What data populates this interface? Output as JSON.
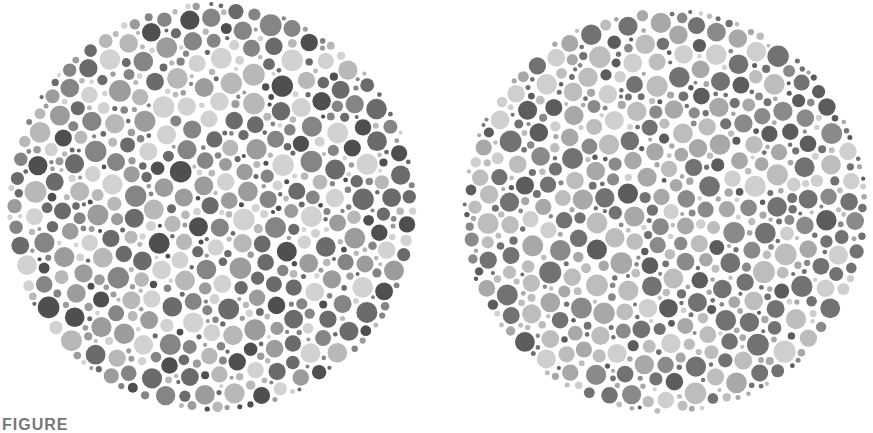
{
  "figure": {
    "caption": "FIGURE"
  },
  "plates": [
    {
      "name": "left-plate",
      "cx": 212,
      "cy": 207,
      "r": 205,
      "seed": 1337,
      "palette": [
        "#4f4f4f",
        "#6b6b6b",
        "#858585",
        "#9c9c9c",
        "#b8b8b8",
        "#d2d2d2"
      ],
      "weights": [
        0.1,
        0.2,
        0.2,
        0.18,
        0.17,
        0.15
      ]
    },
    {
      "name": "right-plate",
      "cx": 665,
      "cy": 211,
      "r": 203,
      "seed": 4242,
      "palette": [
        "#5c5c5c",
        "#727272",
        "#8a8a8a",
        "#a8a8a8",
        "#bdbdbd",
        "#cfcfcf"
      ],
      "weights": [
        0.12,
        0.26,
        0.12,
        0.18,
        0.22,
        0.1
      ]
    }
  ],
  "dots": {
    "min_radius": 2,
    "max_radius": 11,
    "gap": 1.6,
    "attempts": 9000
  }
}
